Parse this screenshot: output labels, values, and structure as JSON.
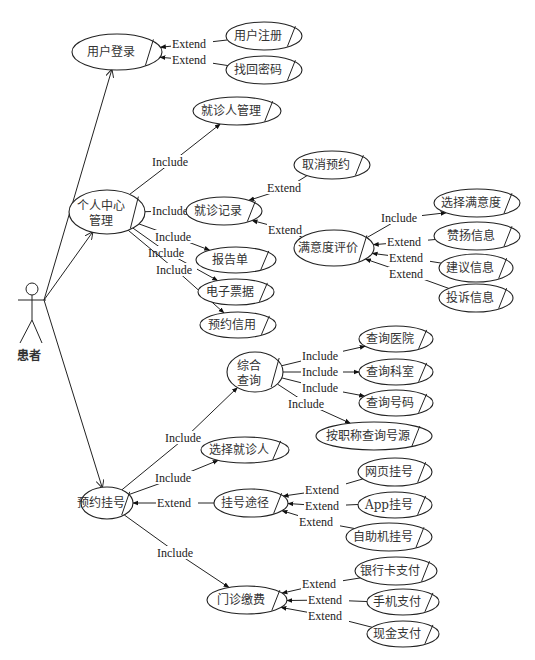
{
  "actor": {
    "label": "患者",
    "x": 32,
    "y": 290
  },
  "use_cases": [
    {
      "id": "login",
      "label": "用户登录",
      "cx": 117,
      "cy": 52,
      "rx": 45,
      "ry": 18
    },
    {
      "id": "register",
      "label": "用户注册",
      "cx": 264,
      "cy": 36,
      "rx": 38,
      "ry": 14
    },
    {
      "id": "recover",
      "label": "找回密码",
      "cx": 264,
      "cy": 70,
      "rx": 38,
      "ry": 14
    },
    {
      "id": "personal",
      "label": "个人中心",
      "label2": "管理",
      "cx": 107,
      "cy": 212,
      "rx": 38,
      "ry": 22
    },
    {
      "id": "patient_mgmt",
      "label": "就诊人管理",
      "cx": 237,
      "cy": 111,
      "rx": 44,
      "ry": 14
    },
    {
      "id": "records",
      "label": "就诊记录",
      "cx": 224,
      "cy": 211,
      "rx": 38,
      "ry": 14
    },
    {
      "id": "cancel",
      "label": "取消预约",
      "cx": 332,
      "cy": 165,
      "rx": 38,
      "ry": 14
    },
    {
      "id": "satisfaction",
      "label": "满意度评价",
      "cx": 334,
      "cy": 248,
      "rx": 40,
      "ry": 18
    },
    {
      "id": "choose_sat",
      "label": "选择满意度",
      "cx": 477,
      "cy": 203,
      "rx": 43,
      "ry": 14
    },
    {
      "id": "praise",
      "label": "赞扬信息",
      "cx": 477,
      "cy": 236,
      "rx": 43,
      "ry": 14
    },
    {
      "id": "suggest",
      "label": "建议信息",
      "cx": 476,
      "cy": 268,
      "rx": 37,
      "ry": 14
    },
    {
      "id": "complain",
      "label": "投诉信息",
      "cx": 476,
      "cy": 298,
      "rx": 37,
      "ry": 14
    },
    {
      "id": "report",
      "label": "报告单",
      "cx": 236,
      "cy": 260,
      "rx": 40,
      "ry": 13
    },
    {
      "id": "ebill",
      "label": "电子票据",
      "cx": 236,
      "cy": 292,
      "rx": 38,
      "ry": 13
    },
    {
      "id": "credit",
      "label": "预约信用",
      "cx": 238,
      "cy": 325,
      "rx": 38,
      "ry": 13
    },
    {
      "id": "search",
      "label": "综合",
      "label2": "查询",
      "cx": 255,
      "cy": 372,
      "rx": 28,
      "ry": 20
    },
    {
      "id": "q_hospital",
      "label": "查询医院",
      "cx": 396,
      "cy": 339,
      "rx": 37,
      "ry": 13
    },
    {
      "id": "q_dept",
      "label": "查询科室",
      "cx": 396,
      "cy": 372,
      "rx": 37,
      "ry": 13
    },
    {
      "id": "q_number",
      "label": "查询号码",
      "cx": 396,
      "cy": 403,
      "rx": 37,
      "ry": 13
    },
    {
      "id": "q_title",
      "label": "按职称查询号源",
      "cx": 374,
      "cy": 436,
      "rx": 58,
      "ry": 14
    },
    {
      "id": "choose_patient",
      "label": "选择就诊人",
      "cx": 245,
      "cy": 450,
      "rx": 44,
      "ry": 13
    },
    {
      "id": "booking",
      "label": "预约挂号",
      "cx": 107,
      "cy": 503,
      "rx": 26,
      "ry": 16
    },
    {
      "id": "channel",
      "label": "挂号途径",
      "cx": 251,
      "cy": 503,
      "rx": 37,
      "ry": 14
    },
    {
      "id": "web",
      "label": "网页挂号",
      "cx": 395,
      "cy": 472,
      "rx": 37,
      "ry": 14
    },
    {
      "id": "app",
      "label": "App挂号",
      "cx": 395,
      "cy": 505,
      "rx": 37,
      "ry": 13
    },
    {
      "id": "kiosk",
      "label": "自助机挂号",
      "cx": 389,
      "cy": 537,
      "rx": 43,
      "ry": 14
    },
    {
      "id": "payment",
      "label": "门诊缴费",
      "cx": 247,
      "cy": 600,
      "rx": 40,
      "ry": 14
    },
    {
      "id": "bank",
      "label": "银行卡支付",
      "cx": 396,
      "cy": 571,
      "rx": 41,
      "ry": 14
    },
    {
      "id": "mobile",
      "label": "手机支付",
      "cx": 403,
      "cy": 602,
      "rx": 36,
      "ry": 13
    },
    {
      "id": "cash",
      "label": "现金支付",
      "cx": 403,
      "cy": 634,
      "rx": 36,
      "ry": 13
    }
  ],
  "relationships": [
    {
      "type": "Extend",
      "label": "Extend",
      "from": "register",
      "to": "login",
      "lx": 172,
      "ly": 48
    },
    {
      "type": "Extend",
      "label": "Extend",
      "from": "recover",
      "to": "login",
      "lx": 172,
      "ly": 64
    },
    {
      "type": "Include",
      "label": "Include",
      "from": "personal",
      "to": "patient_mgmt",
      "lx": 152,
      "ly": 166
    },
    {
      "type": "Include",
      "label": "Include",
      "from": "personal",
      "to": "records",
      "lx": 152,
      "ly": 215
    },
    {
      "type": "Include",
      "label": "Include",
      "from": "personal",
      "to": "report",
      "lx": 155,
      "ly": 241
    },
    {
      "type": "Include",
      "label": "Include",
      "from": "personal",
      "to": "ebill",
      "lx": 148,
      "ly": 257
    },
    {
      "type": "Include",
      "label": "Include",
      "from": "personal",
      "to": "credit",
      "lx": 156,
      "ly": 274
    },
    {
      "type": "Extend",
      "label": "Extend",
      "from": "cancel",
      "to": "records",
      "lx": 267,
      "ly": 192
    },
    {
      "type": "Extend",
      "label": "Extend",
      "from": "satisfaction",
      "to": "records",
      "lx": 268,
      "ly": 234
    },
    {
      "type": "Include",
      "label": "Include",
      "from": "satisfaction",
      "to": "choose_sat",
      "lx": 381,
      "ly": 222
    },
    {
      "type": "Extend",
      "label": "Extend",
      "from": "praise",
      "to": "satisfaction",
      "lx": 387,
      "ly": 246
    },
    {
      "type": "Extend",
      "label": "Extend",
      "from": "suggest",
      "to": "satisfaction",
      "lx": 389,
      "ly": 262
    },
    {
      "type": "Extend",
      "label": "Extend",
      "from": "complain",
      "to": "satisfaction",
      "lx": 389,
      "ly": 278
    },
    {
      "type": "Include",
      "label": "Include",
      "from": "booking",
      "to": "search",
      "lx": 165,
      "ly": 442
    },
    {
      "type": "Include",
      "label": "Include",
      "from": "booking",
      "to": "choose_patient",
      "lx": 155,
      "ly": 482
    },
    {
      "type": "Extend",
      "label": "Extend",
      "from": "channel",
      "to": "booking",
      "lx": 157,
      "ly": 507
    },
    {
      "type": "Include",
      "label": "Include",
      "from": "booking",
      "to": "payment",
      "lx": 157,
      "ly": 557
    },
    {
      "type": "Include",
      "label": "Include",
      "from": "search",
      "to": "q_hospital",
      "lx": 302,
      "ly": 360
    },
    {
      "type": "Include",
      "label": "Include",
      "from": "search",
      "to": "q_dept",
      "lx": 302,
      "ly": 376
    },
    {
      "type": "Include",
      "label": "Include",
      "from": "search",
      "to": "q_number",
      "lx": 302,
      "ly": 392
    },
    {
      "type": "Include",
      "label": "Include",
      "from": "search",
      "to": "q_title",
      "lx": 288,
      "ly": 408
    },
    {
      "type": "Extend",
      "label": "Extend",
      "from": "web",
      "to": "channel",
      "lx": 305,
      "ly": 494
    },
    {
      "type": "Extend",
      "label": "Extend",
      "from": "app",
      "to": "channel",
      "lx": 305,
      "ly": 510
    },
    {
      "type": "Extend",
      "label": "Extend",
      "from": "kiosk",
      "to": "channel",
      "lx": 299,
      "ly": 526
    },
    {
      "type": "Extend",
      "label": "Extend",
      "from": "bank",
      "to": "payment",
      "lx": 302,
      "ly": 588
    },
    {
      "type": "Extend",
      "label": "Extend",
      "from": "mobile",
      "to": "payment",
      "lx": 308,
      "ly": 604
    },
    {
      "type": "Extend",
      "label": "Extend",
      "from": "cash",
      "to": "payment",
      "lx": 308,
      "ly": 620
    }
  ],
  "associations": [
    {
      "from": "actor",
      "to": "login"
    },
    {
      "from": "actor",
      "to": "personal"
    },
    {
      "from": "actor",
      "to": "booking"
    }
  ]
}
